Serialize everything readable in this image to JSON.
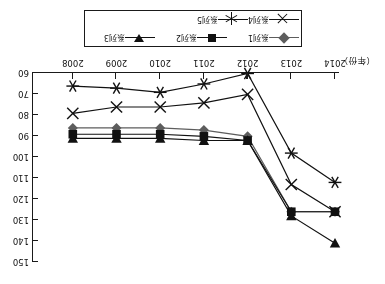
{
  "figure": {
    "rotation_degrees": 180,
    "x_unit_label": "（年份）"
  },
  "legend": {
    "items": [
      {
        "label": "系列1",
        "marker": "diamond",
        "color": "#5d5d5d"
      },
      {
        "label": "系列2",
        "marker": "square",
        "color": "#111111"
      },
      {
        "label": "系列3",
        "marker": "triangle-down",
        "color": "#111111"
      },
      {
        "label": "系列4",
        "marker": "x-cross",
        "color": "#111111"
      },
      {
        "label": "系列5",
        "marker": "six-point-star",
        "color": "#111111"
      }
    ]
  },
  "chart_data": {
    "type": "line",
    "title": "",
    "xlabel": "（年份）",
    "ylabel": "",
    "categories": [
      "2014",
      "2013",
      "2012",
      "2011",
      "2010",
      "2009",
      "2008"
    ],
    "xlim_labels": [
      "2014",
      "2008"
    ],
    "ylim": [
      60,
      150
    ],
    "yticks": [
      60,
      70,
      80,
      90,
      100,
      110,
      120,
      130,
      140,
      150
    ],
    "grid": false,
    "legend_position": "top",
    "axis_orientation": "x-axis descending years left-to-right; y-axis on right side, values increase downward",
    "series": [
      {
        "name": "系列1",
        "marker": "diamond",
        "color": "#5d5d5d",
        "values": [
          126,
          126,
          90,
          87,
          86,
          86,
          86
        ]
      },
      {
        "name": "系列2",
        "marker": "square",
        "color": "#111111",
        "values": [
          126,
          126,
          92,
          90,
          89,
          89,
          89
        ]
      },
      {
        "name": "系列3",
        "marker": "triangle-down",
        "color": "#111111",
        "values": [
          141,
          128,
          92,
          92,
          91,
          91,
          91
        ]
      },
      {
        "name": "系列4",
        "marker": "x-cross",
        "color": "#111111",
        "values": [
          126,
          113,
          70,
          74,
          76,
          76,
          79
        ]
      },
      {
        "name": "系列5",
        "marker": "six-point-star",
        "color": "#111111",
        "values": [
          112,
          98,
          60,
          65,
          69,
          67,
          66
        ]
      }
    ]
  }
}
